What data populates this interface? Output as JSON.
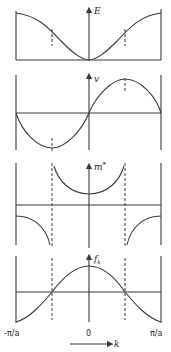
{
  "panels": [
    {
      "id": "energy",
      "ylabel": "E",
      "description": "Energy vs wavevector, cosine-like band with minimum at k=0"
    },
    {
      "id": "velocity",
      "ylabel": "v",
      "description": "Group velocity vs k, sine-like, zero at k=0 and zone edges"
    },
    {
      "id": "effective-mass",
      "ylabel": "m*",
      "ylabel_main": "m",
      "ylabel_sup": "*",
      "description": "Effective mass vs k, diverges at inflection points"
    },
    {
      "id": "f-factor",
      "ylabel": "f_k",
      "ylabel_main": "f",
      "ylabel_sub": "k",
      "description": "f_k factor vs k, positive near center, negative near zone edges"
    }
  ],
  "xaxis": {
    "left_tick": "-π/a",
    "center_tick": "0",
    "right_tick": "π/a",
    "label": "k"
  },
  "colors": {
    "line": "#3a3a3a",
    "background": "#ffffff"
  }
}
